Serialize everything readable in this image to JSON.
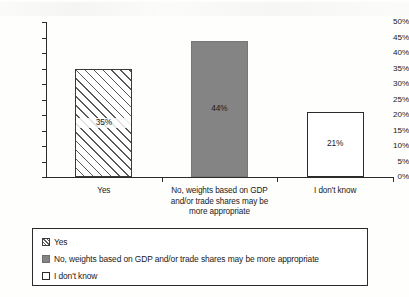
{
  "chart_data": {
    "type": "bar",
    "title": "",
    "xlabel": "",
    "ylabel": "",
    "ylim": [
      0,
      50
    ],
    "ytick_labels": [
      "50%",
      "45%",
      "40%",
      "35%",
      "30%",
      "25%",
      "20%",
      "15%",
      "10%",
      "5%",
      "0%"
    ],
    "ytick_values": [
      50,
      45,
      40,
      35,
      30,
      25,
      20,
      15,
      10,
      5,
      0
    ],
    "grid": false,
    "legend_position": "bottom",
    "categories": [
      "Yes",
      "No, weights based on GDP and/or trade shares may be more appropriate",
      "I don't know"
    ],
    "category_axis_labels": [
      [
        "Yes"
      ],
      [
        "No, weights based on GDP",
        "and/or trade shares may be",
        "more appropriate"
      ],
      [
        "I don't know"
      ]
    ],
    "values": [
      35,
      44,
      21
    ],
    "value_labels": [
      "35%",
      "44%",
      "21%"
    ],
    "bar_styles": [
      "hatched-diagonal",
      "solid-gray",
      "white-outline"
    ],
    "colors": {
      "hatch_line": "#595959",
      "hatch_fill": "#ffffff",
      "solid_gray": "#848484",
      "white_outline_fill": "#ffffff",
      "axis": "#2b2b2b",
      "text": "#1a1a1a",
      "background": "#fefefd"
    },
    "legend": [
      {
        "label": "Yes",
        "style": "hatched-diagonal"
      },
      {
        "label": "No, weights based on GDP and/or trade shares may be more appropriate",
        "style": "solid-gray"
      },
      {
        "label": "I don't know",
        "style": "white-outline"
      }
    ]
  }
}
